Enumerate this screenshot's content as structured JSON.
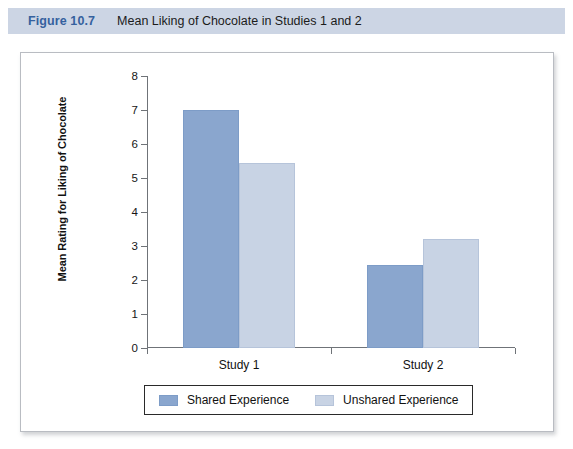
{
  "caption": {
    "number": "Figure 10.7",
    "title": "Mean Liking of Chocolate in Studies 1 and 2"
  },
  "colors": {
    "caption_band": "#ccd5e4",
    "caption_number": "#35619e",
    "shared_bar": "#8aa6ce",
    "unshared_bar": "#c8d3e4",
    "axis": "#6f7378",
    "panel_border": "#b9bcc2"
  },
  "chart_data": {
    "type": "bar",
    "title": "Mean Liking of Chocolate in Studies 1 and 2",
    "xlabel": "",
    "ylabel": "Mean Rating for Liking of Chocolate",
    "categories": [
      "Study 1",
      "Study 2"
    ],
    "series": [
      {
        "name": "Shared Experience",
        "color": "#8aa6ce",
        "values": [
          7.0,
          2.45
        ]
      },
      {
        "name": "Unshared Experience",
        "color": "#c8d3e4",
        "values": [
          5.45,
          3.2
        ]
      }
    ],
    "ylim": [
      0,
      8
    ],
    "yticks": [
      0,
      1,
      2,
      3,
      4,
      5,
      6,
      7,
      8
    ],
    "ytick_labels": [
      "0",
      "1",
      "2",
      "3",
      "4",
      "5",
      "6",
      "7",
      "8"
    ],
    "grid": false,
    "legend_position": "bottom"
  }
}
